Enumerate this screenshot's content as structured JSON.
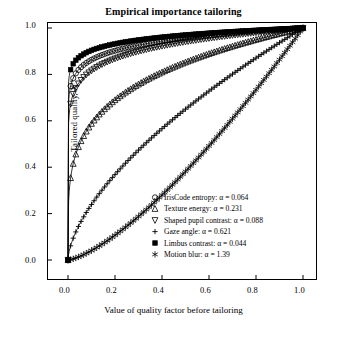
{
  "chart_data": {
    "type": "line",
    "title": "Empirical importance tailoring",
    "xlabel": "Value of quality factor before tailoring",
    "ylabel_plain": "Tailored quality, X",
    "ylabel_sup": "tr",
    "xlim": [
      0.0,
      1.0
    ],
    "ylim": [
      0.0,
      1.0
    ],
    "xticks": [
      "0.0",
      "0.2",
      "0.4",
      "0.6",
      "0.8",
      "1.0"
    ],
    "yticks": [
      "0.0",
      "0.2",
      "0.4",
      "0.6",
      "0.8",
      "1.0"
    ],
    "grid": false,
    "legend_position": "bottom-right",
    "series": [
      {
        "name": "IrisCode entropy",
        "alpha": 0.064,
        "legend_label": "IrisCode entropy: α = 0.064",
        "marker": "circle-open",
        "x": [
          0.0,
          0.02,
          0.04,
          0.06,
          0.08,
          0.1,
          0.15,
          0.2,
          0.3,
          0.4,
          0.5,
          0.6,
          0.7,
          0.8,
          0.9,
          1.0
        ],
        "y": [
          0.0,
          0.787,
          0.834,
          0.859,
          0.875,
          0.887,
          0.907,
          0.92,
          0.938,
          0.95,
          0.96,
          0.968,
          0.976,
          0.984,
          0.992,
          1.0
        ]
      },
      {
        "name": "Texture energy",
        "alpha": 0.231,
        "legend_label": "Texture energy: α = 0.231",
        "marker": "triangle-open",
        "x": [
          0.0,
          0.02,
          0.04,
          0.06,
          0.08,
          0.1,
          0.15,
          0.2,
          0.3,
          0.4,
          0.5,
          0.6,
          0.7,
          0.8,
          0.9,
          1.0
        ],
        "y": [
          0.0,
          0.531,
          0.623,
          0.677,
          0.715,
          0.744,
          0.795,
          0.829,
          0.874,
          0.904,
          0.927,
          0.946,
          0.963,
          0.977,
          0.989,
          1.0
        ]
      },
      {
        "name": "Shaped pupil contrast",
        "alpha": 0.088,
        "legend_label": "Shaped pupil contrast: α = 0.088",
        "marker": "triangle-down-open",
        "x": [
          0.0,
          0.02,
          0.04,
          0.06,
          0.08,
          0.1,
          0.15,
          0.2,
          0.3,
          0.4,
          0.5,
          0.6,
          0.7,
          0.8,
          0.9,
          1.0
        ],
        "y": [
          0.0,
          0.725,
          0.786,
          0.819,
          0.841,
          0.857,
          0.884,
          0.902,
          0.926,
          0.942,
          0.955,
          0.965,
          0.974,
          0.982,
          0.991,
          1.0
        ]
      },
      {
        "name": "Gaze angle",
        "alpha": 0.621,
        "legend_label": "Gaze angle: α = 0.621",
        "marker": "plus-open",
        "x": [
          0.0,
          0.05,
          0.1,
          0.15,
          0.2,
          0.3,
          0.4,
          0.5,
          0.6,
          0.7,
          0.8,
          0.9,
          1.0
        ],
        "y": [
          0.0,
          0.16,
          0.256,
          0.328,
          0.387,
          0.482,
          0.559,
          0.626,
          0.686,
          0.742,
          0.793,
          0.842,
          1.0
        ]
      },
      {
        "name": "Limbus contrast",
        "alpha": 0.044,
        "legend_label": "Limbus contrast: α = 0.044",
        "marker": "square-filled",
        "x": [
          0.0,
          0.02,
          0.04,
          0.06,
          0.08,
          0.1,
          0.15,
          0.2,
          0.3,
          0.4,
          0.5,
          0.6,
          0.7,
          0.8,
          0.9,
          1.0
        ],
        "y": [
          0.0,
          0.84,
          0.874,
          0.893,
          0.905,
          0.914,
          0.93,
          0.94,
          0.954,
          0.963,
          0.97,
          0.976,
          0.982,
          0.988,
          0.994,
          1.0
        ]
      },
      {
        "name": "Motion blur",
        "alpha": 1.39,
        "legend_label": "Motion blur: α = 1.39",
        "marker": "asterisk",
        "x": [
          0.0,
          0.05,
          0.1,
          0.15,
          0.2,
          0.25,
          0.3,
          0.35,
          0.4,
          0.45,
          0.5,
          0.55,
          0.6,
          0.65,
          0.7,
          0.75,
          0.8,
          0.85,
          0.9,
          0.95,
          1.0
        ],
        "y": [
          0.0,
          0.019,
          0.05,
          0.087,
          0.129,
          0.175,
          0.223,
          0.274,
          0.328,
          0.383,
          0.441,
          0.5,
          0.561,
          0.623,
          0.686,
          0.751,
          0.817,
          0.884,
          0.953,
          0.976,
          1.0
        ]
      }
    ]
  },
  "legend": {
    "items": [
      {
        "marker": "circle-open",
        "label": "IrisCode entropy: α = 0.064"
      },
      {
        "marker": "triangle-open",
        "label": "Texture energy: α = 0.231"
      },
      {
        "marker": "triangle-down-open",
        "label": "Shaped pupil contrast: α = 0.088"
      },
      {
        "marker": "plus-open",
        "label": "Gaze angle: α = 0.621"
      },
      {
        "marker": "square-filled",
        "label": "Limbus contrast: α = 0.044"
      },
      {
        "marker": "asterisk",
        "label": "Motion blur: α = 1.39"
      }
    ]
  },
  "colors": {
    "line": "#000000",
    "axis": "#000000",
    "background": "#ffffff"
  }
}
